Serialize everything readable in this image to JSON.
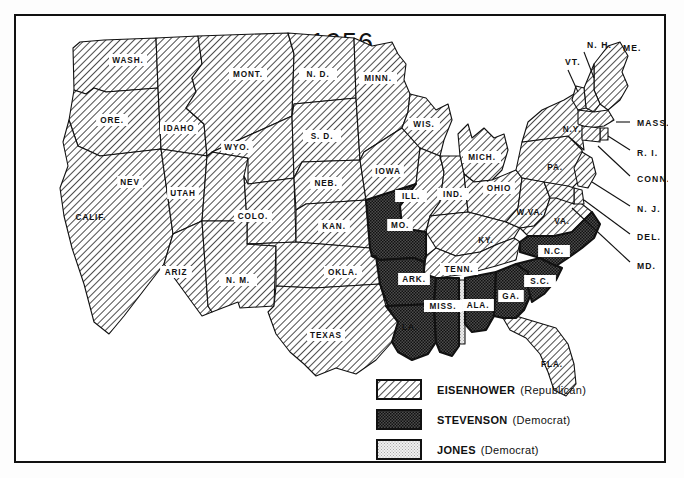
{
  "title": "1956",
  "colors": {
    "ink": "#111111",
    "paper": "#ffffff",
    "eisenhower_fill": "hatch-diagonal",
    "stevenson_fill": "stipple-dark",
    "jones_fill": "stipple-light"
  },
  "legend": [
    {
      "key": "eisenhower",
      "candidate": "EISENHOWER",
      "party": "(Republican)",
      "pattern": "hatch-diagonal"
    },
    {
      "key": "stevenson",
      "candidate": "STEVENSON",
      "party": "(Democrat)",
      "pattern": "stipple-dark"
    },
    {
      "key": "jones",
      "candidate": "JONES",
      "party": "(Democrat)",
      "pattern": "stipple-light"
    }
  ],
  "states": [
    {
      "code": "WASH.",
      "label": "WASH.",
      "winner": "eisenhower",
      "lx": 112,
      "ly": 44,
      "box": true
    },
    {
      "code": "ORE.",
      "label": "ORE.",
      "winner": "eisenhower",
      "lx": 96,
      "ly": 104,
      "box": true
    },
    {
      "code": "CALIF.",
      "label": "CALIF.",
      "winner": "eisenhower",
      "lx": 75,
      "ly": 201,
      "box": false
    },
    {
      "code": "IDAHO",
      "label": "IDAHO",
      "winner": "eisenhower",
      "lx": 163,
      "ly": 112,
      "box": true
    },
    {
      "code": "NEV",
      "label": "NEV",
      "winner": "eisenhower",
      "lx": 114,
      "ly": 166,
      "box": true
    },
    {
      "code": "UTAH",
      "label": "UTAH",
      "winner": "eisenhower",
      "lx": 167,
      "ly": 177,
      "box": true
    },
    {
      "code": "ARIZ",
      "label": "ARIZ",
      "winner": "eisenhower",
      "lx": 160,
      "ly": 256,
      "box": true
    },
    {
      "code": "MONT.",
      "label": "MONT.",
      "winner": "eisenhower",
      "lx": 232,
      "ly": 58,
      "box": true
    },
    {
      "code": "WYO.",
      "label": "WYO.",
      "winner": "eisenhower",
      "lx": 221,
      "ly": 131,
      "box": true
    },
    {
      "code": "COLO.",
      "label": "COLO.",
      "winner": "eisenhower",
      "lx": 237,
      "ly": 200,
      "box": true
    },
    {
      "code": "N.M.",
      "label": "N. M.",
      "winner": "eisenhower",
      "lx": 222,
      "ly": 264,
      "box": true
    },
    {
      "code": "N.D.",
      "label": "N. D.",
      "winner": "eisenhower",
      "lx": 302,
      "ly": 58,
      "box": true
    },
    {
      "code": "S.D.",
      "label": "S. D.",
      "winner": "eisenhower",
      "lx": 306,
      "ly": 120,
      "box": true
    },
    {
      "code": "NEB.",
      "label": "NEB.",
      "winner": "eisenhower",
      "lx": 310,
      "ly": 167,
      "box": true
    },
    {
      "code": "KAN.",
      "label": "KAN.",
      "winner": "eisenhower",
      "lx": 318,
      "ly": 210,
      "box": true
    },
    {
      "code": "OKLA.",
      "label": "OKLA.",
      "winner": "eisenhower",
      "lx": 327,
      "ly": 256,
      "box": true
    },
    {
      "code": "TEXAS",
      "label": "TEXAS",
      "winner": "eisenhower",
      "lx": 310,
      "ly": 319,
      "box": true
    },
    {
      "code": "MINN.",
      "label": "MINN.",
      "winner": "eisenhower",
      "lx": 362,
      "ly": 62,
      "box": true
    },
    {
      "code": "IOWA",
      "label": "IOWA",
      "winner": "eisenhower",
      "lx": 372,
      "ly": 155,
      "box": true
    },
    {
      "code": "WIS.",
      "label": "WIS.",
      "winner": "eisenhower",
      "lx": 408,
      "ly": 108,
      "box": true
    },
    {
      "code": "ILL.",
      "label": "ILL.",
      "winner": "eisenhower",
      "lx": 395,
      "ly": 180,
      "box": true
    },
    {
      "code": "MICH.",
      "label": "MICH.",
      "winner": "eisenhower",
      "lx": 466,
      "ly": 141,
      "box": true
    },
    {
      "code": "IND.",
      "label": "IND.",
      "winner": "eisenhower",
      "lx": 437,
      "ly": 178,
      "box": true
    },
    {
      "code": "OHIO",
      "label": "OHIO",
      "winner": "eisenhower",
      "lx": 483,
      "ly": 172,
      "box": true
    },
    {
      "code": "KY.",
      "label": "KY.",
      "winner": "eisenhower",
      "lx": 470,
      "ly": 224,
      "box": false
    },
    {
      "code": "PA.",
      "label": "PA.",
      "winner": "eisenhower",
      "lx": 539,
      "ly": 151,
      "box": false
    },
    {
      "code": "W.VA.",
      "label": "W.VA.",
      "winner": "eisenhower",
      "lx": 514,
      "ly": 196,
      "box": false
    },
    {
      "code": "VA.",
      "label": "VA.",
      "winner": "eisenhower",
      "lx": 546,
      "ly": 205,
      "box": false
    },
    {
      "code": "N.Y.",
      "label": "N.Y.",
      "winner": "eisenhower",
      "lx": 556,
      "ly": 113,
      "box": false
    },
    {
      "code": "TENN.",
      "label": "TENN.",
      "winner": "eisenhower",
      "lx": 443,
      "ly": 253,
      "box": true
    },
    {
      "code": "FLA.",
      "label": "FLA.",
      "winner": "eisenhower",
      "lx": 536,
      "ly": 348,
      "box": false
    },
    {
      "code": "MO.",
      "label": "MO.",
      "winner": "stevenson",
      "lx": 384,
      "ly": 209,
      "box": true
    },
    {
      "code": "ARK.",
      "label": "ARK.",
      "winner": "stevenson",
      "lx": 398,
      "ly": 263,
      "box": true
    },
    {
      "code": "LA.",
      "label": "LA.",
      "winner": "stevenson",
      "lx": 394,
      "ly": 311,
      "box": false
    },
    {
      "code": "MISS.",
      "label": "MISS.",
      "winner": "stevenson",
      "lx": 427,
      "ly": 290,
      "box": true
    },
    {
      "code": "ALA.",
      "label": "ALA.",
      "winner": "stevenson",
      "lx": 462,
      "ly": 289,
      "box": true
    },
    {
      "code": "GA.",
      "label": "GA.",
      "winner": "stevenson",
      "lx": 495,
      "ly": 280,
      "box": true
    },
    {
      "code": "S.C.",
      "label": "S.C.",
      "winner": "stevenson",
      "lx": 524,
      "ly": 265,
      "box": true
    },
    {
      "code": "N.C.",
      "label": "N.C.",
      "winner": "stevenson",
      "lx": 538,
      "ly": 235,
      "box": true
    }
  ],
  "callouts": [
    {
      "code": "N.H.",
      "label": "N. H.",
      "tx": 571,
      "ty": 30
    },
    {
      "code": "VT.",
      "label": "VT.",
      "tx": 549,
      "ty": 47
    },
    {
      "code": "ME.",
      "label": "ME.",
      "tx": 607,
      "ty": 33
    },
    {
      "code": "MASS.",
      "label": "MASS.",
      "tx": 621,
      "ty": 108
    },
    {
      "code": "R.I.",
      "label": "R. I.",
      "tx": 621,
      "ty": 138
    },
    {
      "code": "CONN.",
      "label": "CONN.",
      "tx": 621,
      "ty": 164
    },
    {
      "code": "N.J.",
      "label": "N. J.",
      "tx": 621,
      "ty": 194
    },
    {
      "code": "DEL.",
      "label": "DEL.",
      "tx": 621,
      "ty": 222
    },
    {
      "code": "MD.",
      "label": "MD.",
      "tx": 621,
      "ty": 251
    }
  ]
}
